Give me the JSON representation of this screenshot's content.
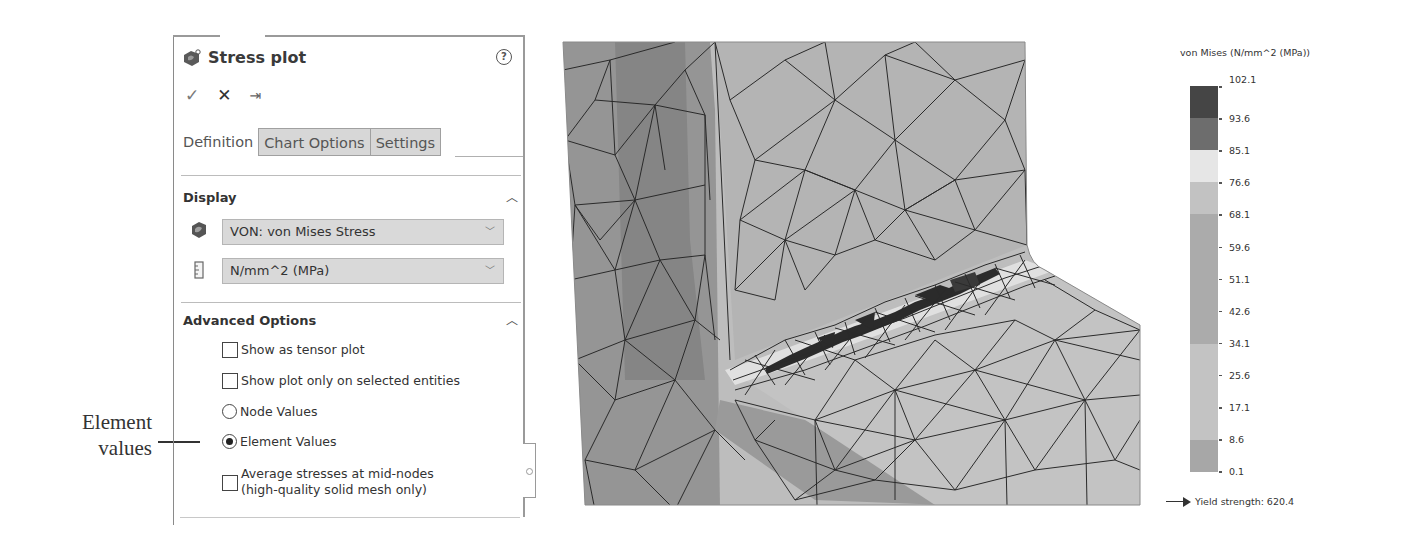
{
  "annotation": {
    "line1": "Element",
    "line2": "values"
  },
  "panel": {
    "title": "Stress plot",
    "help_icon": "help-circle-icon",
    "actions": {
      "ok": "✓",
      "cancel": "✕",
      "pin": "⇥"
    },
    "tabs": [
      {
        "label": "Definition",
        "active": true
      },
      {
        "label": "Chart Options",
        "active": false
      },
      {
        "label": "Settings",
        "active": false
      }
    ],
    "display": {
      "header": "Display",
      "component": {
        "value": "VON: von Mises Stress",
        "icon": "stress-component-icon"
      },
      "units": {
        "value": "N/mm^2 (MPa)",
        "icon": "ruler-icon"
      }
    },
    "advanced": {
      "header": "Advanced Options",
      "show_tensor": {
        "label": "Show as tensor plot",
        "checked": false
      },
      "show_selected": {
        "label": "Show plot only on selected entities",
        "checked": false
      },
      "node_values": {
        "label": "Node Values",
        "selected": false
      },
      "element_values": {
        "label": "Element Values",
        "selected": true
      },
      "average_mid": {
        "label_line1": "Average stresses at mid-nodes",
        "label_line2": "(high-quality solid mesh only)",
        "checked": false
      }
    }
  },
  "legend": {
    "title": "von Mises (N/mm^2 (MPa))",
    "ticks": [
      "102.1",
      "93.6",
      "85.1",
      "76.6",
      "68.1",
      "59.6",
      "51.1",
      "42.6",
      "34.1",
      "25.6",
      "17.1",
      "8.6",
      "0.1"
    ],
    "bands": [
      {
        "from": "93.6",
        "to": "102.1",
        "color": "#454545"
      },
      {
        "from": "85.1",
        "to": "93.6",
        "color": "#6d6d6d"
      },
      {
        "from": "76.6",
        "to": "85.1",
        "color": "#e6e6e6"
      },
      {
        "from": "68.1",
        "to": "76.6",
        "color": "#c2c2c2"
      },
      {
        "from": "34.1",
        "to": "68.1",
        "color": "#ababab"
      },
      {
        "from": "8.6",
        "to": "34.1",
        "color": "#c3c3c3"
      },
      {
        "from": "0.1",
        "to": "8.6",
        "color": "#a7a7a7"
      }
    ],
    "yield_strength": "Yield strength: 620.4"
  },
  "colors": {
    "mesh_face_light": "#bdbdbd",
    "mesh_face_mid": "#a5a5a5",
    "mesh_face_dark": "#8e8e8e",
    "mesh_edge": "#2a2a2a",
    "hotspot": "#2b2b2b"
  }
}
